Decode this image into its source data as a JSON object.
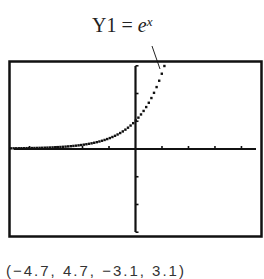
{
  "chart_data": {
    "type": "line",
    "function": "e^x",
    "label_parts": {
      "name": "Y1",
      "equals": "=",
      "base": "e",
      "exponent": "x"
    },
    "window": {
      "xmin": -4.7,
      "xmax": 4.7,
      "ymin": -3.1,
      "ymax": 3.1,
      "xscl": 1,
      "yscl": 1
    },
    "window_text": "(−4.7, 4.7, −3.1, 3.1)",
    "x": [
      -4.7,
      -4.0,
      -3.0,
      -2.0,
      -1.5,
      -1.0,
      -0.5,
      0.0,
      0.25,
      0.5,
      0.75,
      1.0,
      1.13
    ],
    "y": [
      0.009,
      0.018,
      0.05,
      0.135,
      0.223,
      0.368,
      0.607,
      1.0,
      1.284,
      1.649,
      2.117,
      2.718,
      3.1
    ],
    "xlabel": "",
    "ylabel": "",
    "grid": false,
    "style": "dotted calculator plot"
  },
  "colors": {
    "ink": "#111111",
    "background": "#ffffff"
  }
}
